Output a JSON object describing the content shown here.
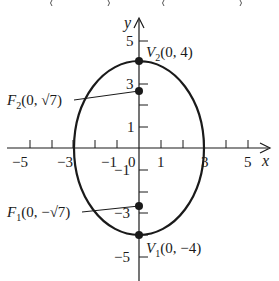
{
  "diagram": {
    "type": "ellipse-graph",
    "equation_context": "ellipse centered at origin, major axis vertical",
    "axes": {
      "x_label": "x",
      "y_label": "y",
      "x_ticks": [
        -5,
        -4,
        -3,
        -2,
        -1,
        1,
        2,
        3,
        4,
        5
      ],
      "y_ticks": [
        -5,
        -4,
        -3,
        -2,
        -1,
        1,
        2,
        3,
        4,
        5
      ],
      "x_tick_labels": {
        "neg5": "−5",
        "neg3": "−3",
        "neg1": "−1",
        "zero": "0",
        "pos1": "1",
        "pos3": "3",
        "pos5": "5"
      },
      "y_tick_labels": {
        "pos5": "5",
        "pos3": "3",
        "pos1": "1",
        "neg1": "−1",
        "neg3": "−3",
        "neg5": "−5"
      }
    },
    "ellipse": {
      "center": [
        0,
        0
      ],
      "a": 4,
      "b": 3,
      "stroke": "#1a1a1a"
    },
    "points": {
      "v2": {
        "name": "V",
        "sub": "2",
        "coords": "(0, 4)",
        "x": 0,
        "y": 4
      },
      "f2": {
        "name": "F",
        "sub": "2",
        "coords": "(0, √7)",
        "x": 0,
        "y": 2.6458
      },
      "f1": {
        "name": "F",
        "sub": "1",
        "coords": "(0, −√7)",
        "x": 0,
        "y": -2.6458
      },
      "v1": {
        "name": "V",
        "sub": "1",
        "coords": "(0, −4)",
        "x": 0,
        "y": -4
      }
    },
    "colors": {
      "ink": "#1a1a1a",
      "background": "#ffffff"
    }
  }
}
